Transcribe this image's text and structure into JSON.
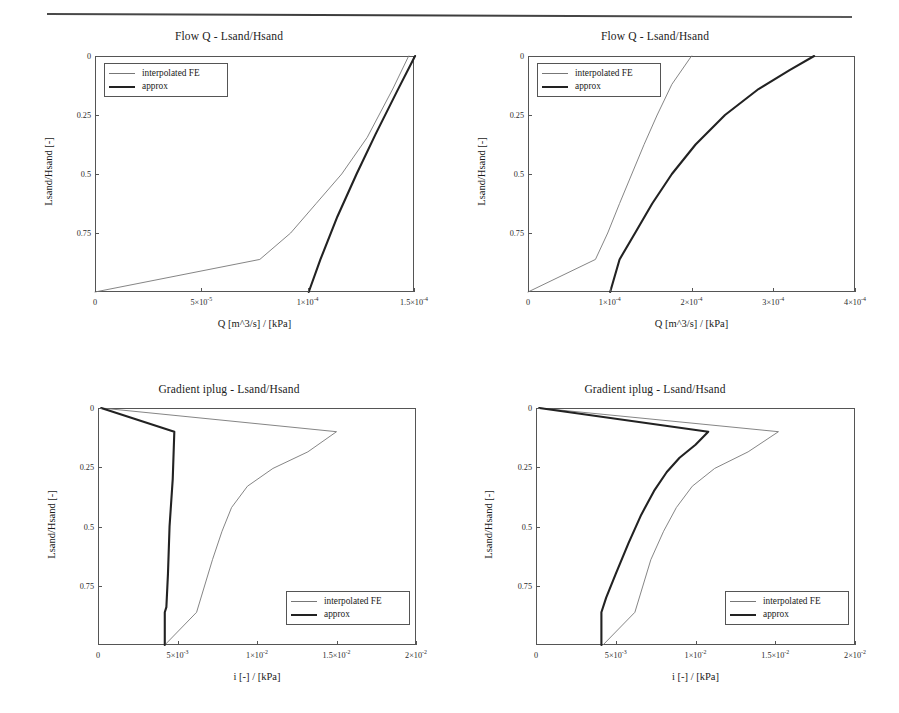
{
  "page": {
    "header_rule": "horizontal-rule"
  },
  "legend_labels": {
    "interpolated": "interpolated FE",
    "approx": "approx"
  },
  "charts": [
    {
      "id": "flow-q-left",
      "title": "Flow Q - Lsand/Hsand",
      "xlabel": "Q [m^3/s] / [kPa]",
      "ylabel": "Lsand/Hsand [-]",
      "legend_position": "top-left",
      "xticks": [
        "0",
        "5×10⁻⁵",
        "1×10⁻⁴",
        "1.5×10⁻⁴"
      ],
      "yticks": [
        "0",
        "0.25",
        "0.5",
        "0.75"
      ]
    },
    {
      "id": "flow-q-right",
      "title": "Flow Q - Lsand/Hsand",
      "xlabel": "Q [m^3/s] / [kPa]",
      "ylabel": "Lsand/Hsand [-]",
      "legend_position": "top-left",
      "xticks": [
        "0",
        "1×10⁻⁴",
        "2×10⁻⁴",
        "3×10⁻⁴",
        "4×10⁻⁴"
      ],
      "yticks": [
        "0",
        "0.25",
        "0.5",
        "0.75"
      ]
    },
    {
      "id": "gradient-iplug-left",
      "title": "Gradient iplug - Lsand/Hsand",
      "xlabel": "i [-] / [kPa]",
      "ylabel": "Lsand/Hsand [-]",
      "legend_position": "bottom-right",
      "xticks": [
        "0",
        "5×10⁻³",
        "1×10⁻²",
        "1.5×10⁻²",
        "2×10⁻²"
      ],
      "yticks": [
        "0",
        "0.25",
        "0.5",
        "0.75"
      ]
    },
    {
      "id": "gradient-iplug-right",
      "title": "Gradient iplug - Lsand/Hsand",
      "xlabel": "i [-] / [kPa]",
      "ylabel": "Lsand/Hsand [-]",
      "legend_position": "bottom-right",
      "xticks": [
        "0",
        "5×10⁻³",
        "1×10⁻²",
        "1.5×10⁻²",
        "2×10⁻²"
      ],
      "yticks": [
        "0",
        "0.25",
        "0.5",
        "0.75"
      ]
    }
  ],
  "chart_data": [
    {
      "type": "line",
      "id": "flow-q-left",
      "title": "Flow Q - Lsand/Hsand",
      "xlabel": "Q [m^3/s] / [kPa]",
      "ylabel": "Lsand/Hsand [-]",
      "xlim": [
        0,
        0.00015
      ],
      "ylim": [
        0,
        1
      ],
      "y_axis_inverted": true,
      "xticks": [
        0,
        5e-05,
        0.0001,
        0.00015
      ],
      "yticks": [
        0,
        0.25,
        0.5,
        0.75
      ],
      "grid": false,
      "legend_position": "top-left",
      "series": [
        {
          "name": "interpolated FE",
          "style": "thin",
          "color": "#777777",
          "x": [
            0.0,
            7.75e-05,
            9.2e-05,
            0.000104,
            0.000116,
            0.000128,
            0.00014,
            0.0001475
          ],
          "y": [
            1.0,
            0.862,
            0.75,
            0.625,
            0.5,
            0.345,
            0.14,
            0.0
          ]
        },
        {
          "name": "approx",
          "style": "thick",
          "color": "#222222",
          "x": [
            0.0001005,
            0.000106,
            0.000114,
            0.000123,
            0.000132,
            0.000142,
            0.0001505
          ],
          "y": [
            1.0,
            0.862,
            0.68,
            0.5,
            0.33,
            0.15,
            0.0
          ]
        }
      ]
    },
    {
      "type": "line",
      "id": "flow-q-right",
      "title": "Flow Q - Lsand/Hsand",
      "xlabel": "Q [m^3/s] / [kPa]",
      "ylabel": "Lsand/Hsand [-]",
      "xlim": [
        0,
        0.0004
      ],
      "ylim": [
        0,
        1
      ],
      "y_axis_inverted": true,
      "xticks": [
        0,
        0.0001,
        0.0002,
        0.0003,
        0.0004
      ],
      "yticks": [
        0,
        0.25,
        0.5,
        0.75
      ],
      "grid": false,
      "legend_position": "top-left",
      "series": [
        {
          "name": "interpolated FE",
          "style": "thin",
          "color": "#777777",
          "x": [
            0.0,
            8.25e-05,
            9.75e-05,
            0.000112,
            0.000127,
            0.000142,
            0.000158,
            0.000176,
            0.0002
          ],
          "y": [
            1.0,
            0.862,
            0.75,
            0.625,
            0.5,
            0.375,
            0.25,
            0.12,
            0.0
          ]
        },
        {
          "name": "approx",
          "style": "thick",
          "color": "#222222",
          "x": [
            0.0001005,
            0.000112,
            0.000131,
            0.000152,
            0.000176,
            0.000205,
            0.000241,
            0.000282,
            0.00032,
            0.00035
          ],
          "y": [
            1.0,
            0.862,
            0.75,
            0.625,
            0.5,
            0.375,
            0.25,
            0.14,
            0.06,
            0.0
          ]
        }
      ]
    },
    {
      "type": "line",
      "id": "gradient-iplug-left",
      "title": "Gradient iplug - Lsand/Hsand",
      "xlabel": "i [-] / [kPa]",
      "ylabel": "Lsand/Hsand [-]",
      "xlim": [
        0,
        0.02
      ],
      "ylim": [
        0,
        1
      ],
      "y_axis_inverted": true,
      "xticks": [
        0,
        0.005,
        0.01,
        0.015,
        0.02
      ],
      "yticks": [
        0,
        0.25,
        0.5,
        0.75
      ],
      "grid": false,
      "legend_position": "bottom-right",
      "series": [
        {
          "name": "interpolated FE",
          "style": "thin",
          "color": "#777777",
          "x": [
            0.0002,
            0.015,
            0.0132,
            0.011,
            0.0094,
            0.0084,
            0.0078,
            0.0072,
            0.0062,
            0.0042
          ],
          "y": [
            0.0,
            0.1,
            0.185,
            0.255,
            0.33,
            0.42,
            0.52,
            0.64,
            0.862,
            1.0
          ]
        },
        {
          "name": "approx",
          "style": "thick",
          "color": "#222222",
          "x": [
            0.0002,
            0.0048,
            0.0047,
            0.0045,
            0.0044,
            0.0043,
            0.0042,
            0.0042
          ],
          "y": [
            0.0,
            0.1,
            0.3,
            0.5,
            0.7,
            0.84,
            0.862,
            1.0
          ]
        }
      ]
    },
    {
      "type": "line",
      "id": "gradient-iplug-right",
      "title": "Gradient iplug - Lsand/Hsand",
      "xlabel": "i [-] / [kPa]",
      "ylabel": "Lsand/Hsand [-]",
      "xlim": [
        0,
        0.02
      ],
      "ylim": [
        0,
        1
      ],
      "y_axis_inverted": true,
      "xticks": [
        0,
        0.005,
        0.01,
        0.015,
        0.02
      ],
      "yticks": [
        0,
        0.25,
        0.5,
        0.75
      ],
      "grid": false,
      "legend_position": "bottom-right",
      "series": [
        {
          "name": "interpolated FE",
          "style": "thin",
          "color": "#777777",
          "x": [
            0.0002,
            0.0152,
            0.0133,
            0.0112,
            0.0098,
            0.0088,
            0.008,
            0.0072,
            0.0062,
            0.0042
          ],
          "y": [
            0.0,
            0.1,
            0.185,
            0.255,
            0.33,
            0.42,
            0.52,
            0.64,
            0.862,
            1.0
          ]
        },
        {
          "name": "approx",
          "style": "thick",
          "color": "#222222",
          "x": [
            0.0002,
            0.0108,
            0.01,
            0.009,
            0.0082,
            0.0074,
            0.0066,
            0.0058,
            0.005,
            0.0044,
            0.0041,
            0.0041
          ],
          "y": [
            0.0,
            0.1,
            0.155,
            0.21,
            0.27,
            0.35,
            0.45,
            0.57,
            0.7,
            0.8,
            0.862,
            1.0
          ]
        }
      ]
    }
  ]
}
